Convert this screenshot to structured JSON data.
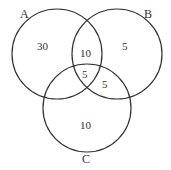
{
  "diagram": {
    "type": "venn",
    "sets": [
      {
        "label": "A",
        "cx": 57,
        "cy": 54,
        "r": 45
      },
      {
        "label": "B",
        "cx": 117,
        "cy": 54,
        "r": 45
      },
      {
        "label": "C",
        "cx": 87,
        "cy": 108,
        "r": 44
      }
    ],
    "regions": {
      "A_only": "30",
      "A_and_B": "10",
      "B_only": "5",
      "A_B_C": "5",
      "B_and_C": "5",
      "C_only": "10"
    },
    "stroke_color": "#333333"
  }
}
